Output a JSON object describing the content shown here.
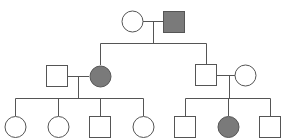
{
  "diagram": {
    "type": "pedigree",
    "colors": {
      "line": "#555555",
      "affected_fill": "#7a7a7a",
      "unaffected_fill": "#ffffff"
    },
    "generations": [
      {
        "label": "I",
        "individuals": [
          {
            "id": "I-1",
            "sex": "female",
            "affected": false
          },
          {
            "id": "I-2",
            "sex": "male",
            "affected": true
          }
        ]
      },
      {
        "label": "II",
        "individuals": [
          {
            "id": "II-1",
            "sex": "male",
            "affected": false,
            "note": "spouse"
          },
          {
            "id": "II-2",
            "sex": "female",
            "affected": true,
            "note": "child of I-1 x I-2"
          },
          {
            "id": "II-3",
            "sex": "male",
            "affected": false,
            "note": "child of I-1 x I-2"
          },
          {
            "id": "II-4",
            "sex": "female",
            "affected": false,
            "note": "spouse"
          }
        ]
      },
      {
        "label": "III",
        "individuals": [
          {
            "id": "III-1",
            "sex": "female",
            "affected": false,
            "parents": "II-1 x II-2"
          },
          {
            "id": "III-2",
            "sex": "female",
            "affected": false,
            "parents": "II-1 x II-2"
          },
          {
            "id": "III-3",
            "sex": "male",
            "affected": false,
            "parents": "II-1 x II-2"
          },
          {
            "id": "III-4",
            "sex": "female",
            "affected": false,
            "parents": "II-1 x II-2"
          },
          {
            "id": "III-5",
            "sex": "male",
            "affected": false,
            "parents": "II-3 x II-4"
          },
          {
            "id": "III-6",
            "sex": "female",
            "affected": true,
            "parents": "II-3 x II-4"
          },
          {
            "id": "III-7",
            "sex": "male",
            "affected": false,
            "parents": "II-3 x II-4"
          }
        ]
      }
    ]
  }
}
